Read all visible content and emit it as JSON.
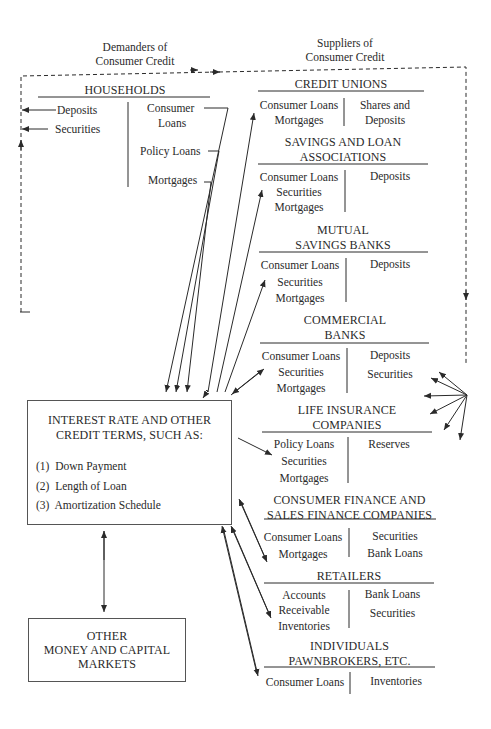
{
  "headings": {
    "demanders": [
      "Demanders of",
      "Consumer Credit"
    ],
    "suppliers": [
      "Suppliers of",
      "Consumer Credit"
    ]
  },
  "households": {
    "title": "HOUSEHOLDS",
    "assets": [
      "Deposits",
      "Securities"
    ],
    "liabilities": [
      "Consumer",
      "Loans",
      "Policy Loans",
      "Mortgages"
    ]
  },
  "central_box": {
    "title": [
      "INTEREST RATE AND OTHER",
      "CREDIT TERMS, SUCH AS:"
    ],
    "items": [
      {
        "num": "(1)",
        "label": "Down Payment"
      },
      {
        "num": "(2)",
        "label": "Length of Loan"
      },
      {
        "num": "(3)",
        "label": "Amortization Schedule"
      }
    ]
  },
  "other_markets": {
    "title": [
      "OTHER",
      "MONEY AND CAPITAL",
      "MARKETS"
    ]
  },
  "suppliers": [
    {
      "title": [
        "CREDIT UNIONS"
      ],
      "assets": [
        "Consumer Loans",
        "Mortgages"
      ],
      "liabilities": [
        "Shares and",
        "Deposits"
      ]
    },
    {
      "title": [
        "SAVINGS AND LOAN",
        "ASSOCIATIONS"
      ],
      "assets": [
        "Consumer Loans",
        "Securities",
        "Mortgages"
      ],
      "liabilities": [
        "Deposits"
      ]
    },
    {
      "title": [
        "MUTUAL",
        "SAVINGS BANKS"
      ],
      "assets": [
        "Consumer Loans",
        "Securities",
        "Mortgages"
      ],
      "liabilities": [
        "Deposits"
      ]
    },
    {
      "title": [
        "COMMERCIAL",
        "BANKS"
      ],
      "assets": [
        "Consumer Loans",
        "Securities",
        "Mortgages"
      ],
      "liabilities": [
        "Deposits",
        "Securities"
      ]
    },
    {
      "title": [
        "LIFE INSURANCE",
        "COMPANIES"
      ],
      "assets": [
        "Policy Loans",
        "Securities",
        "Mortgages"
      ],
      "liabilities": [
        "Reserves"
      ]
    },
    {
      "title": [
        "CONSUMER FINANCE AND",
        "SALES FINANCE COMPANIES"
      ],
      "assets": [
        "Consumer Loans",
        "Mortgages"
      ],
      "liabilities": [
        "Securities",
        "Bank Loans"
      ]
    },
    {
      "title": [
        "RETAILERS"
      ],
      "assets": [
        "Accounts",
        "Receivable",
        "Inventories"
      ],
      "liabilities": [
        "Bank Loans",
        "Securities"
      ]
    },
    {
      "title": [
        "INDIVIDUALS",
        "PAWNBROKERS, ETC."
      ],
      "assets": [
        "Consumer Loans"
      ],
      "liabilities": [
        "Inventories"
      ]
    }
  ],
  "colors": {
    "ink": "#2a2a2a",
    "paper": "#ffffff"
  }
}
